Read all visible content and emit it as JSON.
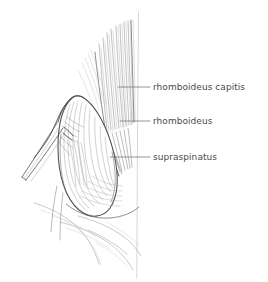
{
  "figure": {
    "background_color": "#ffffff",
    "ink_color": "#555555",
    "label_color": "#4a4a4a",
    "width": 268,
    "height": 282
  },
  "midline": {
    "name": "dorsal-midline",
    "color": "#cfcfcf",
    "x": 138,
    "y_top": 12,
    "y_bottom": 278
  },
  "annotations": [
    {
      "id": "rhomboideus-capitis",
      "label": "rhomboideus capitis",
      "text_x": 153,
      "text_y": 87,
      "leader_x_start": 118,
      "leader_x_end": 150,
      "leader_y": 87
    },
    {
      "id": "rhomboideus",
      "label": "rhomboideus",
      "text_x": 153,
      "text_y": 121,
      "leader_x_start": 120,
      "leader_x_end": 150,
      "leader_y": 121
    },
    {
      "id": "supraspinatus",
      "label": "supraspinatus",
      "text_x": 153,
      "text_y": 157,
      "leader_x_start": 110,
      "leader_x_end": 150,
      "leader_y": 157
    }
  ]
}
